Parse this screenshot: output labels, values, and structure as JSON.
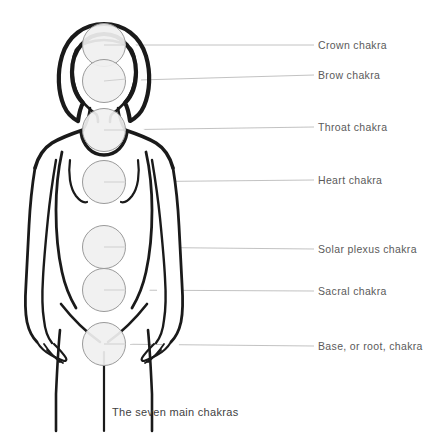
{
  "diagram": {
    "caption": "The seven main chakras",
    "caption_x": 112,
    "caption_y": 407,
    "background_color": "#ffffff",
    "body_outline_color": "#1a1a1a",
    "chakra_fill_color": "#f0f0f0",
    "chakra_stroke_color": "#999999",
    "leader_line_color": "#bbbbbb",
    "label_color": "#5a5a5a",
    "label_x": 318,
    "leader_line_end_x": 314,
    "chakra_radius": 21.5
  },
  "chakras": [
    {
      "id": "crown",
      "label": "Crown chakra",
      "cx": 104,
      "cy": 45,
      "label_y": 45
    },
    {
      "id": "brow",
      "label": "Brow chakra",
      "cx": 104,
      "cy": 81,
      "label_y": 75
    },
    {
      "id": "throat",
      "label": "Throat chakra",
      "cx": 104,
      "cy": 130,
      "label_y": 127
    },
    {
      "id": "heart",
      "label": "Heart chakra",
      "cx": 104,
      "cy": 182,
      "label_y": 180
    },
    {
      "id": "solar-plexus",
      "label": "Solar plexus chakra",
      "cx": 104,
      "cy": 247,
      "label_y": 249
    },
    {
      "id": "sacral",
      "label": "Sacral chakra",
      "cx": 104,
      "cy": 290,
      "label_y": 291
    },
    {
      "id": "base",
      "label": "Base, or root, chakra",
      "cx": 104,
      "cy": 344,
      "label_y": 346
    }
  ]
}
